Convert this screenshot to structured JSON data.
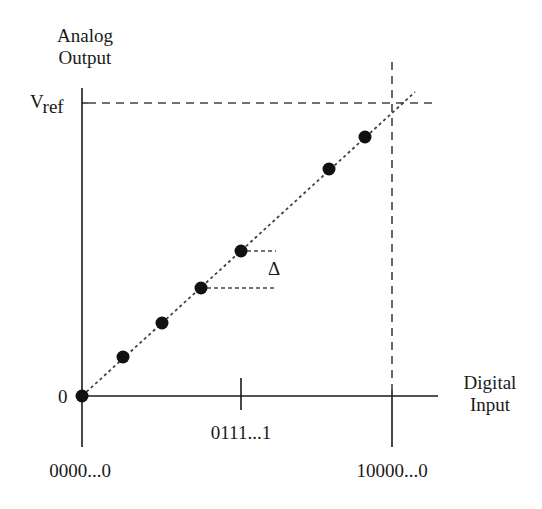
{
  "diagram": {
    "type": "DAC transfer characteristic",
    "y_axis": {
      "label_line1": "Analog",
      "label_line2": "Output"
    },
    "x_axis": {
      "label_line1": "Digital",
      "label_line2": "Input"
    },
    "y_ticks": {
      "vref_main": "V",
      "vref_sub": "ref",
      "zero": "0"
    },
    "x_ticks": {
      "origin": "0000...0",
      "mid": "0111...1",
      "full": "10000...0"
    },
    "step_label": "Δ",
    "points": [
      [
        82,
        396
      ],
      [
        123,
        357
      ],
      [
        162,
        323
      ],
      [
        201,
        288
      ],
      [
        241,
        251
      ],
      [
        329,
        169
      ],
      [
        365,
        137
      ]
    ],
    "colors": {
      "ink": "#1a1a1a",
      "dash": "#444444",
      "background": "#ffffff"
    }
  }
}
